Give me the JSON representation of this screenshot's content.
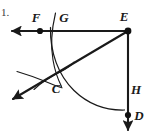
{
  "figure": {
    "item_number": "1.",
    "type": "geometry-construction",
    "stroke_color": "#1a1a1a",
    "background_color": "#ffffff",
    "labels": [
      {
        "text": "F",
        "x": 36,
        "y": 22
      },
      {
        "text": "G",
        "x": 64,
        "y": 22
      },
      {
        "text": "E",
        "x": 124,
        "y": 21
      },
      {
        "text": "C",
        "x": 56,
        "y": 88
      },
      {
        "text": "H",
        "x": 133,
        "y": 94
      },
      {
        "text": "D",
        "x": 136,
        "y": 120
      }
    ],
    "points": [
      {
        "name": "F",
        "x": 40,
        "y": 31,
        "marked": true
      },
      {
        "name": "E",
        "x": 128,
        "y": 31,
        "marked": true
      },
      {
        "name": "D",
        "x": 128,
        "y": 115,
        "marked": true
      }
    ],
    "rays": [
      {
        "name": "ray-E-left-through-F",
        "from": "E",
        "to_x": 8,
        "to_y": 31,
        "arrowhead": "end"
      },
      {
        "name": "ray-E-down-through-D",
        "from": "E",
        "to_x": 128,
        "to_y": 134,
        "arrowhead": "end"
      },
      {
        "name": "ray-E-diagonal-through-C",
        "from": "E",
        "to_x": 10,
        "to_y": 100,
        "arrowhead": "end"
      }
    ],
    "arcs": [
      {
        "name": "main-arc-centered-at-E",
        "center": "E",
        "radius": 78
      },
      {
        "name": "arc-through-G",
        "note": "small compass arc crossing horizontal ray near G"
      },
      {
        "name": "arc-through-C-upper",
        "note": "construction arc intersecting at C"
      },
      {
        "name": "arc-through-C-lower",
        "note": "construction arc intersecting at C"
      }
    ]
  }
}
